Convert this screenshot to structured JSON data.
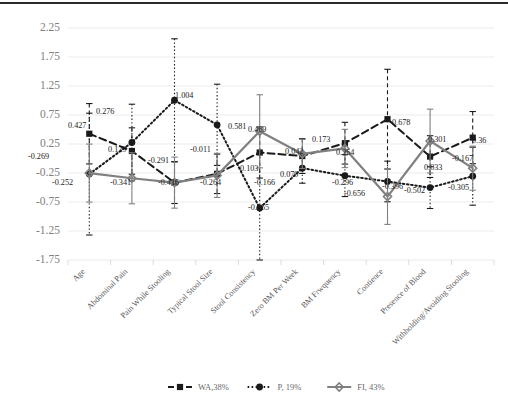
{
  "chart_data": {
    "type": "line",
    "title": "",
    "subtitle": "",
    "xlabel": "",
    "ylabel": "",
    "ylim": [
      -1.75,
      2.25
    ],
    "ytick_step": 0.5,
    "yticks": [
      "2.25",
      "1.75",
      "1.25",
      "0.75",
      "0.25",
      "-0.25",
      "-0.75",
      "-1.25",
      "-1.75"
    ],
    "grid": true,
    "legend_position": "bottom",
    "categories": [
      "Age",
      "Abdominal Pain",
      "Pain While Stooling",
      "Typical Stool Size",
      "Stool Consistency",
      "Zero BM Per Week",
      "BM Frwquency",
      "Contience",
      "Presence of Blood",
      "Withholding/Avoiding Stooling"
    ],
    "series": [
      {
        "name": "WA,38%",
        "marker": "square",
        "line_style": "dashed",
        "color": "#1a1a1a",
        "values": [
          0.427,
          0.129,
          -0.416,
          -0.264,
          0.103,
          0.042,
          0.264,
          0.678,
          0.033,
          0.36
        ],
        "errors": [
          0.52,
          0.4,
          0.36,
          0.34,
          0.44,
          0.3,
          0.36,
          0.86,
          0.36,
          0.45
        ]
      },
      {
        "name": "P, 19%",
        "marker": "circle",
        "line_style": "dotted",
        "color": "#1a1a1a",
        "values": [
          -0.269,
          0.276,
          1.004,
          0.581,
          -0.855,
          -0.166,
          -0.296,
          -0.396,
          -0.502,
          -0.305
        ],
        "errors": [
          1.05,
          0.66,
          1.06,
          0.7,
          0.95,
          0.26,
          0.36,
          0.35,
          0.36,
          0.5
        ]
      },
      {
        "name": "FI, 43%",
        "marker": "diamond",
        "line_style": "solid",
        "color": "#808080",
        "values": [
          -0.252,
          -0.341,
          -0.416,
          -0.291,
          0.469,
          0.079,
          0.173,
          -0.656,
          0.301,
          -0.167
        ],
        "errors": [
          0.5,
          0.44,
          0.44,
          0.38,
          0.63,
          0.25,
          0.33,
          0.48,
          0.55,
          0.38
        ]
      }
    ],
    "point_labels": [
      {
        "text": "0.427",
        "x": 68,
        "y": 128
      },
      {
        "text": "0.129",
        "x": 108,
        "y": 152
      },
      {
        "text": "0.276",
        "x": 96,
        "y": 114
      },
      {
        "text": "1.004",
        "x": 175,
        "y": 98
      },
      {
        "text": "-0.269",
        "x": 28,
        "y": 159
      },
      {
        "text": "-0.252",
        "x": 52,
        "y": 185
      },
      {
        "text": "-0.341",
        "x": 110,
        "y": 185
      },
      {
        "text": "-0.416",
        "x": 158,
        "y": 185
      },
      {
        "text": "-0.291",
        "x": 148,
        "y": 163
      },
      {
        "text": "-0.011",
        "x": 190,
        "y": 152
      },
      {
        "text": "0.581",
        "x": 228,
        "y": 129
      },
      {
        "text": "-0.264",
        "x": 200,
        "y": 185
      },
      {
        "text": "0.469",
        "x": 248,
        "y": 132
      },
      {
        "text": "0.103",
        "x": 240,
        "y": 171
      },
      {
        "text": "-0.855",
        "x": 248,
        "y": 210
      },
      {
        "text": "0.042",
        "x": 285,
        "y": 154
      },
      {
        "text": "0.079",
        "x": 280,
        "y": 177
      },
      {
        "text": "-0.166",
        "x": 254,
        "y": 185
      },
      {
        "text": "0.173",
        "x": 312,
        "y": 142
      },
      {
        "text": "0.264",
        "x": 336,
        "y": 155
      },
      {
        "text": "-0.296",
        "x": 332,
        "y": 185
      },
      {
        "text": "0.678",
        "x": 392,
        "y": 125
      },
      {
        "text": "-0.656",
        "x": 344,
        "y": 196
      },
      {
        "text": "-0.396",
        "x": 382,
        "y": 189
      },
      {
        "text": "0.301",
        "x": 428,
        "y": 142
      },
      {
        "text": "0.033",
        "x": 424,
        "y": 170
      },
      {
        "text": "-0.502",
        "x": 404,
        "y": 193
      },
      {
        "text": "0.36",
        "x": 472,
        "y": 143
      },
      {
        "text": "-0.167",
        "x": 452,
        "y": 161
      },
      {
        "text": "-0.305",
        "x": 448,
        "y": 190
      }
    ]
  },
  "legend": {
    "items": [
      {
        "label": "WA,38%",
        "marker": "square",
        "style": "dashed",
        "color": "#1a1a1a"
      },
      {
        "label": "P, 19%",
        "marker": "circle",
        "style": "dotted",
        "color": "#1a1a1a"
      },
      {
        "label": "FI, 43%",
        "marker": "diamond",
        "style": "solid",
        "color": "#808080"
      }
    ]
  },
  "colors": {
    "grid": "#e9e9e9",
    "axis_text": "#808080",
    "category_text": "#5a5a5a",
    "label_text": "#1a1a1a",
    "series_dark": "#1a1a1a",
    "series_gray": "#808080",
    "frame": "#2b2b2b"
  }
}
